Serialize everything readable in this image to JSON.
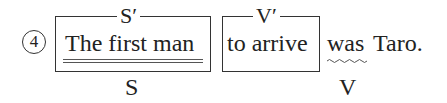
{
  "item": {
    "number": "4",
    "segments": [
      {
        "text": "The first man",
        "top_label": "S′",
        "bottom_label": "S",
        "boxed": true,
        "underline": "double"
      },
      {
        "text": "to arrive",
        "top_label": "V′",
        "boxed": true
      },
      {
        "text": "was",
        "bottom_label": "V",
        "underline": "wavy"
      },
      {
        "text": "Taro."
      }
    ]
  }
}
